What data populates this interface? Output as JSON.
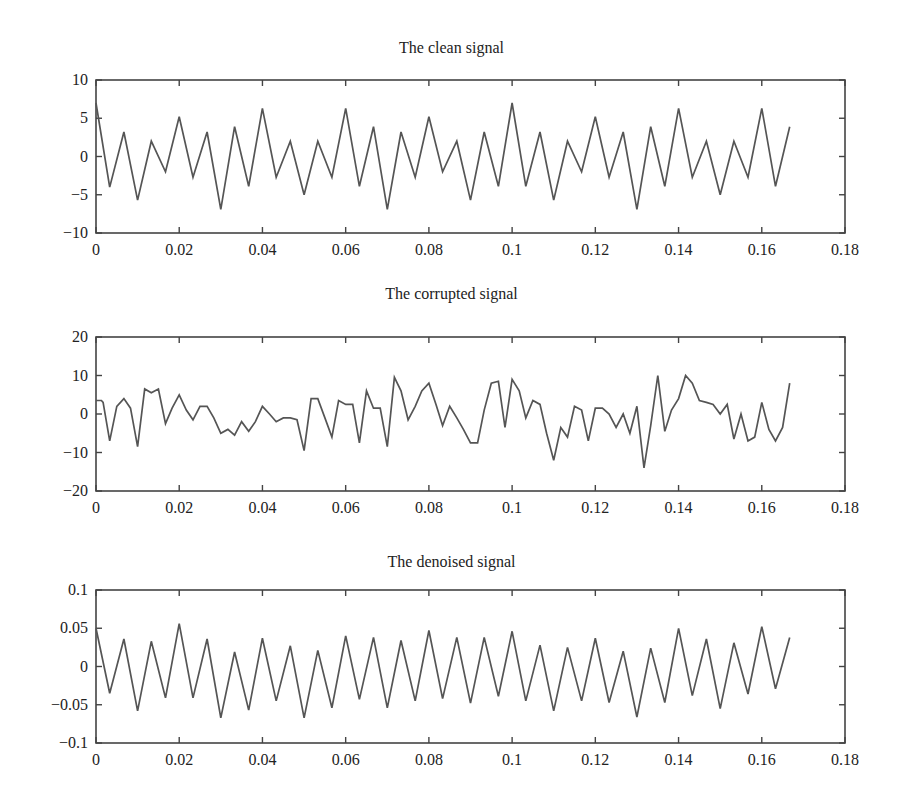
{
  "figure": {
    "panels": [
      {
        "title": "The clean signal"
      },
      {
        "title": "The corrupted signal"
      },
      {
        "title": "The denoised signal"
      }
    ]
  },
  "chart_data": [
    {
      "type": "line",
      "title": "The clean signal",
      "xlabel": "",
      "ylabel": "",
      "xlim": [
        0,
        0.18
      ],
      "ylim": [
        -10,
        10
      ],
      "xticks": [
        "0",
        "0.02",
        "0.04",
        "0.06",
        "0.08",
        "0.1",
        "0.12",
        "0.14",
        "0.16",
        "0.18"
      ],
      "yticks": [
        "10",
        "5",
        "0",
        "−5",
        "−10"
      ],
      "ytick_values": [
        10,
        5,
        0,
        -5,
        -10
      ],
      "grid": false,
      "legend": null,
      "series": [
        {
          "name": "clean",
          "x": [
            0,
            0.0033,
            0.0067,
            0.01,
            0.0133,
            0.0167,
            0.02,
            0.0233,
            0.0267,
            0.03,
            0.0333,
            0.0367,
            0.04,
            0.0433,
            0.0467,
            0.05,
            0.0533,
            0.0567,
            0.06,
            0.0633,
            0.0667,
            0.07,
            0.0733,
            0.0767,
            0.08,
            0.0833,
            0.0867,
            0.09,
            0.0933,
            0.0967,
            0.1,
            0.1033,
            0.1067,
            0.11,
            0.1133,
            0.1167,
            0.12,
            0.1233,
            0.1267,
            0.13,
            0.1333,
            0.1367,
            0.14,
            0.1433,
            0.1467,
            0.15,
            0.1533,
            0.1567,
            0.16,
            0.1633,
            0.1667
          ],
          "y": [
            7,
            -4,
            3.2,
            -5.7,
            2,
            -2,
            5.2,
            -2.7,
            3.2,
            -6.9,
            3.9,
            -3.9,
            6.3,
            -2.7,
            2,
            -5,
            2,
            -2.7,
            6.3,
            -3.9,
            3.9,
            -6.9,
            3.2,
            -2.7,
            5.2,
            -2,
            2,
            -5.7,
            3.2,
            -3.9,
            7,
            -3.9,
            3.2,
            -5.7,
            2,
            -2,
            5.2,
            -2.7,
            3.2,
            -6.9,
            3.9,
            -3.9,
            6.3,
            -2.7,
            2,
            -5,
            2,
            -2.7,
            6.3,
            -3.9,
            3.9
          ]
        }
      ]
    },
    {
      "type": "line",
      "title": "The corrupted signal",
      "xlabel": "",
      "ylabel": "",
      "xlim": [
        0,
        0.18
      ],
      "ylim": [
        -20,
        20
      ],
      "xticks": [
        "0",
        "0.02",
        "0.04",
        "0.06",
        "0.08",
        "0.1",
        "0.12",
        "0.14",
        "0.16",
        "0.18"
      ],
      "yticks": [
        "20",
        "10",
        "0",
        "−10",
        "−20"
      ],
      "ytick_values": [
        20,
        10,
        0,
        -10,
        -20
      ],
      "grid": false,
      "legend": null,
      "series": [
        {
          "name": "corrupted",
          "x": [
            0,
            0.0013,
            0.0017,
            0.0033,
            0.005,
            0.0067,
            0.0083,
            0.01,
            0.0117,
            0.0133,
            0.015,
            0.0167,
            0.0183,
            0.02,
            0.0217,
            0.0233,
            0.025,
            0.0267,
            0.0283,
            0.03,
            0.0317,
            0.0333,
            0.035,
            0.0367,
            0.0383,
            0.04,
            0.0417,
            0.0433,
            0.045,
            0.0467,
            0.0483,
            0.05,
            0.0517,
            0.0533,
            0.055,
            0.0567,
            0.0583,
            0.06,
            0.0617,
            0.0633,
            0.065,
            0.0667,
            0.0683,
            0.07,
            0.0717,
            0.0733,
            0.075,
            0.0767,
            0.0783,
            0.08,
            0.0817,
            0.0833,
            0.085,
            0.0867,
            0.0883,
            0.09,
            0.0917,
            0.0933,
            0.095,
            0.0967,
            0.0983,
            0.1,
            0.1017,
            0.1033,
            0.105,
            0.1067,
            0.1083,
            0.11,
            0.1117,
            0.1133,
            0.115,
            0.1167,
            0.1183,
            0.12,
            0.1217,
            0.1233,
            0.125,
            0.1267,
            0.1283,
            0.13,
            0.1317,
            0.1333,
            0.135,
            0.1367,
            0.1383,
            0.14,
            0.1417,
            0.1433,
            0.145,
            0.1467,
            0.1483,
            0.15,
            0.1517,
            0.1533,
            0.155,
            0.1567,
            0.1583,
            0.16,
            0.1617,
            0.1633,
            0.165,
            0.1667
          ],
          "y": [
            3.5,
            3.5,
            3,
            -7,
            2,
            4,
            1.5,
            -8.5,
            6.5,
            5.5,
            6.5,
            -2.5,
            1.5,
            5,
            1,
            -1.5,
            2,
            2,
            -1,
            -5,
            -4,
            -5.5,
            -2,
            -4.5,
            -2,
            2,
            0,
            -2,
            -1,
            -1,
            -1.5,
            -9.5,
            4,
            4,
            -1,
            -6,
            3.5,
            2.5,
            2.5,
            -7.5,
            6,
            1.5,
            1.5,
            -8.5,
            9.5,
            6,
            -1.5,
            2,
            6,
            8,
            2.5,
            -3,
            2,
            -1,
            -4,
            -7.5,
            -7.5,
            1,
            8,
            8.5,
            -3.5,
            9,
            6,
            -1,
            3.5,
            2.5,
            -5,
            -12,
            -3.5,
            -6,
            2,
            1,
            -7,
            1.5,
            1.5,
            0,
            -3.5,
            0,
            -5,
            2,
            -14,
            -3,
            10,
            -4.5,
            1,
            4,
            10,
            8,
            3.5,
            3,
            2.5,
            0,
            2.5,
            -6.5,
            0,
            -7,
            -6,
            3,
            -4,
            -7,
            -3.5,
            8
          ]
        }
      ]
    },
    {
      "type": "line",
      "title": "The denoised signal",
      "xlabel": "",
      "ylabel": "",
      "xlim": [
        0,
        0.18
      ],
      "ylim": [
        -0.1,
        0.1
      ],
      "xticks": [
        "0",
        "0.02",
        "0.04",
        "0.06",
        "0.08",
        "0.1",
        "0.12",
        "0.14",
        "0.16",
        "0.18"
      ],
      "yticks": [
        "0.1",
        "0.05",
        "0",
        "−0.05",
        "−0.1"
      ],
      "ytick_values": [
        0.1,
        0.05,
        0,
        -0.05,
        -0.1
      ],
      "grid": false,
      "legend": null,
      "series": [
        {
          "name": "denoised",
          "x": [
            0,
            0.0033,
            0.0067,
            0.01,
            0.0133,
            0.0167,
            0.02,
            0.0233,
            0.0267,
            0.03,
            0.0333,
            0.0367,
            0.04,
            0.0433,
            0.0467,
            0.05,
            0.0533,
            0.0567,
            0.06,
            0.0633,
            0.0667,
            0.07,
            0.0733,
            0.0767,
            0.08,
            0.0833,
            0.0867,
            0.09,
            0.0933,
            0.0967,
            0.1,
            0.1033,
            0.1067,
            0.11,
            0.1133,
            0.1167,
            0.12,
            0.1233,
            0.1267,
            0.13,
            0.1333,
            0.1367,
            0.14,
            0.1433,
            0.1467,
            0.15,
            0.1533,
            0.1567,
            0.16,
            0.1633,
            0.1667
          ],
          "y": [
            0.05,
            -0.035,
            0.036,
            -0.058,
            0.033,
            -0.041,
            0.056,
            -0.041,
            0.036,
            -0.067,
            0.019,
            -0.057,
            0.037,
            -0.045,
            0.027,
            -0.067,
            0.021,
            -0.054,
            0.04,
            -0.043,
            0.038,
            -0.054,
            0.034,
            -0.045,
            0.047,
            -0.042,
            0.038,
            -0.048,
            0.038,
            -0.039,
            0.046,
            -0.045,
            0.028,
            -0.058,
            0.025,
            -0.045,
            0.037,
            -0.047,
            0.02,
            -0.066,
            0.024,
            -0.047,
            0.05,
            -0.038,
            0.036,
            -0.055,
            0.031,
            -0.036,
            0.052,
            -0.029,
            0.038
          ]
        }
      ]
    }
  ]
}
